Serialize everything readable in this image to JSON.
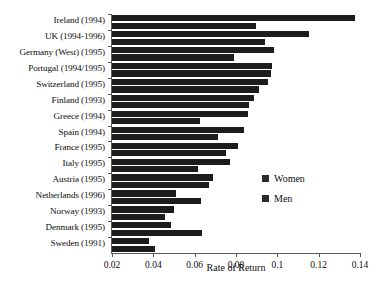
{
  "chart_data": {
    "type": "bar",
    "orientation": "horizontal",
    "title": "",
    "xlabel": "Rate of Return",
    "ylabel": "",
    "xlim": [
      0.02,
      0.14
    ],
    "xticks": [
      0.02,
      0.04,
      0.06,
      0.08,
      0.1,
      0.12,
      0.14
    ],
    "xticklabels": [
      "0.02",
      "0.04",
      "0.06",
      "0.08",
      "0.1",
      "0.12",
      "0.14"
    ],
    "grid": false,
    "legend_position": "center-right",
    "categories": [
      "Ireland (1994)",
      "UK (1994-1996)",
      "Germany (West) (1995)",
      "Portugal (1994/1995)",
      "Switzerland (1995)",
      "Finland (1993)",
      "Greece (1994)",
      "Spain (1994)",
      "France (1995)",
      "Italy (1995)",
      "Austria (1995)",
      "Netherlands (1996)",
      "Norway (1993)",
      "Denmark (1995)",
      "Sweden (1991)"
    ],
    "series": [
      {
        "name": "Women",
        "values": [
          0.1375,
          0.1155,
          0.0985,
          0.0975,
          0.0955,
          0.0885,
          0.086,
          0.084,
          0.081,
          0.077,
          0.069,
          0.051,
          0.05,
          0.0485,
          0.038
        ]
      },
      {
        "name": "Men",
        "values": [
          0.0895,
          0.094,
          0.079,
          0.097,
          0.091,
          0.0865,
          0.0625,
          0.0715,
          0.075,
          0.0615,
          0.067,
          0.063,
          0.0455,
          0.0635,
          0.041
        ]
      }
    ]
  },
  "legend": {
    "items": [
      {
        "label": "Women"
      },
      {
        "label": "Men"
      }
    ]
  }
}
